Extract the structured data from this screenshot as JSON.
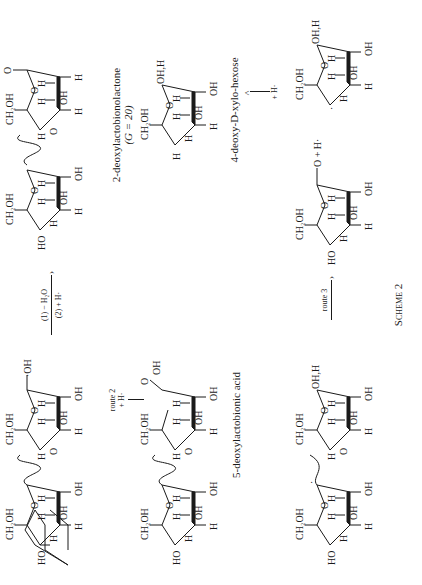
{
  "scheme": {
    "title": "Scheme 2",
    "orientation": "rotated -90deg (landscape scheme on portrait page)",
    "rows": [
      {
        "row": 1,
        "reactant": {
          "name": "lactobiose radical dimer (C-1 radical with OH)",
          "labels": [
            "HO",
            "CH2OH",
            "O",
            "H",
            "OH",
            "H",
            "H",
            "OH",
            "H",
            "H",
            "CH2OH",
            "O",
            "H",
            "OH",
            "H",
            "H",
            "OH",
            "H",
            "OH"
          ]
        },
        "arrow": {
          "top": "(1) − H2O",
          "bottom": "(2) + H·",
          "direction": "right"
        },
        "product": {
          "name": "2-deoxylactobionolactone",
          "caption": "2-deoxylactobionolactone",
          "note": "(G = 20)"
        }
      },
      {
        "row": 2,
        "arrow_route2": {
          "label": "route 2",
          "sub": "+ H·",
          "direction": "down"
        },
        "product_left": {
          "name": "5-deoxylactobionic acid",
          "caption": "5-deoxylactobionic acid"
        },
        "arrow_h": {
          "label": "+ H·",
          "direction": "up"
        },
        "product_right": {
          "name": "4-deoxy-D-xylo-hexose",
          "caption": "4-deoxy-D-xylo-hexose"
        }
      },
      {
        "row": 3,
        "reactant": {
          "name": "radical dimer"
        },
        "arrow": {
          "label": "route 3",
          "direction": "right"
        },
        "products": [
          "lactone",
          "+ H·",
          "C-4 radical hexose (OH,H)"
        ]
      }
    ]
  },
  "labels": {
    "ch2oh": "CH2OH",
    "oh": "OH",
    "ho": "HO",
    "h": "H",
    "o": "O",
    "ohh": "OH,H",
    "plus": "+",
    "hdot": "H·"
  },
  "captions": {
    "lactone": "2-deoxylactobionolactone",
    "g_value": "(G = 20)",
    "acid": "5-deoxylactobionic acid",
    "hexose": "4-deoxy-D-xylo-hexose",
    "scheme": "Scheme 2"
  },
  "arrows": {
    "a1_top": "(1) − H₂O",
    "a1_bottom": "(2) + H·",
    "route2": "route 2",
    "route2_sub": "+ H·",
    "h_add": "+ H·",
    "route3": "route 3"
  }
}
